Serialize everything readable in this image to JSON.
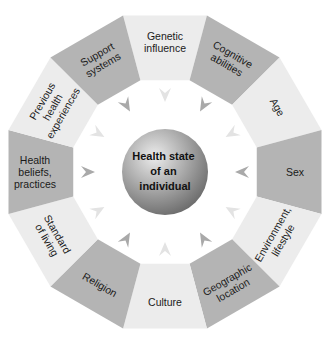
{
  "diagram": {
    "title": "Health state of an individual",
    "center": {
      "lines": [
        "Health state",
        "of an",
        "individual"
      ]
    },
    "colors": {
      "dark_segment": "#b4b4b4",
      "light_segment": "#ececec",
      "arrow_dark": "#a9a9a9",
      "arrow_light": "#e3e3e3",
      "sphere_highlight": "#e6e6e6",
      "sphere_shadow": "#6e6e6e"
    },
    "segments": [
      {
        "id": "genetic-influence",
        "lines": [
          "Genetic",
          "influence"
        ],
        "shade": "light",
        "angle": 0
      },
      {
        "id": "cognitive-abilities",
        "lines": [
          "Cognitive",
          "abilities"
        ],
        "shade": "dark",
        "angle": 30
      },
      {
        "id": "age",
        "lines": [
          "Age"
        ],
        "shade": "light",
        "angle": 60
      },
      {
        "id": "sex",
        "lines": [
          "Sex"
        ],
        "shade": "dark",
        "angle": 90
      },
      {
        "id": "environment-lifestyle",
        "lines": [
          "Environment,",
          "lifestyle"
        ],
        "shade": "light",
        "angle": 120
      },
      {
        "id": "geographic-location",
        "lines": [
          "Geographic",
          "location"
        ],
        "shade": "dark",
        "angle": 150
      },
      {
        "id": "culture",
        "lines": [
          "Culture"
        ],
        "shade": "light",
        "angle": 180
      },
      {
        "id": "religion",
        "lines": [
          "Religion"
        ],
        "shade": "dark",
        "angle": 210
      },
      {
        "id": "standard-of-living",
        "lines": [
          "Standard",
          "of living"
        ],
        "shade": "light",
        "angle": 240
      },
      {
        "id": "health-beliefs-practices",
        "lines": [
          "Health",
          "beliefs,",
          "practices"
        ],
        "shade": "dark",
        "angle": 270
      },
      {
        "id": "previous-health-experiences",
        "lines": [
          "Previous",
          "health",
          "experiences"
        ],
        "shade": "light",
        "angle": 300
      },
      {
        "id": "support-systems",
        "lines": [
          "Support",
          "systems"
        ],
        "shade": "dark",
        "angle": 330
      }
    ]
  }
}
